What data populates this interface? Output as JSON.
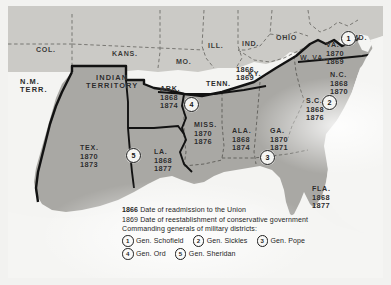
{
  "map": {
    "title": "Reconstruction of the South",
    "colors": {
      "confederate_fill": "#a8a7a3",
      "union_fill": "#c9c8c4",
      "border_dark": "#141414",
      "state_dashed": "#6f6e6a",
      "sea": "#f5f5f3"
    },
    "free_states": [
      {
        "name": "COL.",
        "x": 36,
        "y": 36
      },
      {
        "name": "KANS.",
        "x": 112,
        "y": 40
      },
      {
        "name": "MO.",
        "x": 176,
        "y": 47
      },
      {
        "name": "ILL.",
        "x": 207,
        "y": 32
      },
      {
        "name": "IND.",
        "x": 241,
        "y": 30
      },
      {
        "name": "OHIO",
        "x": 276,
        "y": 24
      },
      {
        "name": "KY.",
        "x": 247,
        "y": 60
      },
      {
        "name": "W. VA.",
        "x": 302,
        "y": 44
      },
      {
        "name": "MD.",
        "x": 352,
        "y": 24
      }
    ],
    "territories": [
      {
        "name": "N.M.\nTERR.",
        "line1": "N.M.",
        "line2": "TERR.",
        "x": 18,
        "y": 78
      },
      {
        "name": "INDIAN TERRITORY",
        "line1": "INDIAN",
        "line2": "TERRITORY",
        "x": 88,
        "y": 74
      }
    ],
    "confederate_states": [
      {
        "abbr": "ARK.",
        "readmission": "1868",
        "conservative": "1874",
        "x": 158,
        "y": 84
      },
      {
        "abbr": "TENN.",
        "readmission": "1866",
        "conservative": "1869",
        "x": 213,
        "y": 68,
        "inline": true
      },
      {
        "abbr": "VA.",
        "readmission": "1870",
        "conservative": "1869",
        "x": 323,
        "y": 40
      },
      {
        "abbr": "N.C.",
        "readmission": "1868",
        "conservative": "1870",
        "x": 329,
        "y": 70
      },
      {
        "abbr": "S.C.",
        "readmission": "1868",
        "conservative": "1876",
        "x": 305,
        "y": 96
      },
      {
        "abbr": "GA.",
        "readmission": "1870",
        "conservative": "1871",
        "x": 269,
        "y": 127
      },
      {
        "abbr": "ALA.",
        "readmission": "1868",
        "conservative": "1874",
        "x": 232,
        "y": 127
      },
      {
        "abbr": "MISS.",
        "readmission": "1870",
        "conservative": "1876",
        "x": 194,
        "y": 120
      },
      {
        "abbr": "LA.",
        "readmission": "1868",
        "conservative": "1877",
        "x": 152,
        "y": 147
      },
      {
        "abbr": "TEX.",
        "readmission": "1870",
        "conservative": "1873",
        "x": 80,
        "y": 143
      },
      {
        "abbr": "FLA.",
        "readmission": "1868",
        "conservative": "1877",
        "x": 311,
        "y": 184
      }
    ],
    "district_markers": [
      {
        "number": "1",
        "x": 339,
        "y": 31
      },
      {
        "number": "2",
        "x": 320,
        "y": 95
      },
      {
        "number": "3",
        "x": 258,
        "y": 150
      },
      {
        "number": "4",
        "x": 182,
        "y": 97
      },
      {
        "number": "5",
        "x": 124,
        "y": 148
      }
    ]
  },
  "legend": {
    "line1_year": "1866",
    "line1_text": "Date of readmission to the Union",
    "line2_year": "1869",
    "line2_text": "Date of reestablishment of conservative government",
    "line3_text": "Commanding generals of military districts:",
    "generals": [
      {
        "number": "1",
        "name": "Gen. Schofield"
      },
      {
        "number": "2",
        "name": "Gen. Sickles"
      },
      {
        "number": "3",
        "name": "Gen. Pope"
      },
      {
        "number": "4",
        "name": "Gen. Ord"
      },
      {
        "number": "5",
        "name": "Gen. Sheridan"
      }
    ]
  }
}
